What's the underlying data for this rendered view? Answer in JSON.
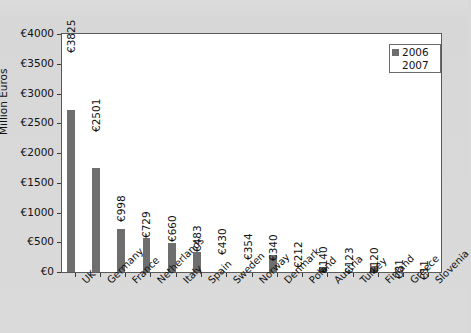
{
  "chart_data": {
    "type": "bar",
    "title": "",
    "xlabel": "",
    "ylabel": "Million Euros",
    "ylim": [
      0,
      4000
    ],
    "ytick_values": [
      0,
      500,
      1000,
      1500,
      2000,
      2500,
      3000,
      3500,
      4000
    ],
    "ytick_labels": [
      "€0",
      "€500",
      "€1000",
      "€1500",
      "€2000",
      "€2500",
      "€3000",
      "€3500",
      "€4000"
    ],
    "grid": false,
    "legend_position": "top-right",
    "categories": [
      "UK",
      "Germany",
      "France",
      "Netherlands",
      "Italy",
      "Spain",
      "Sweden",
      "Norway",
      "Denmark",
      "Poland",
      "Austria",
      "Turkey",
      "Finland",
      "Greece",
      "Slovenia"
    ],
    "series": [
      {
        "name": "2006",
        "color": "#6e6e6e",
        "values": [
          2730,
          1750,
          730,
          580,
          490,
          340,
          0,
          0,
          290,
          0,
          90,
          0,
          95,
          25,
          8
        ]
      },
      {
        "name": "2007",
        "color": "#ffffff",
        "values": [
          3825,
          2501,
          998,
          729,
          660,
          483,
          430,
          354,
          340,
          212,
          140,
          123,
          120,
          31,
          11
        ]
      }
    ],
    "data_labels": [
      "€3825",
      "€2501",
      "€998",
      "€729",
      "€660",
      "€483",
      "€430",
      "€354",
      "€340",
      "€212",
      "€140",
      "€123",
      "€120",
      "€31",
      "€11"
    ],
    "data_label_series": "2007"
  },
  "legend": {
    "entries": [
      {
        "label": "2006",
        "color": "#6e6e6e"
      },
      {
        "label": "2007",
        "color": "#ffffff"
      }
    ]
  },
  "axes": {
    "y_title": "Million Euros"
  }
}
